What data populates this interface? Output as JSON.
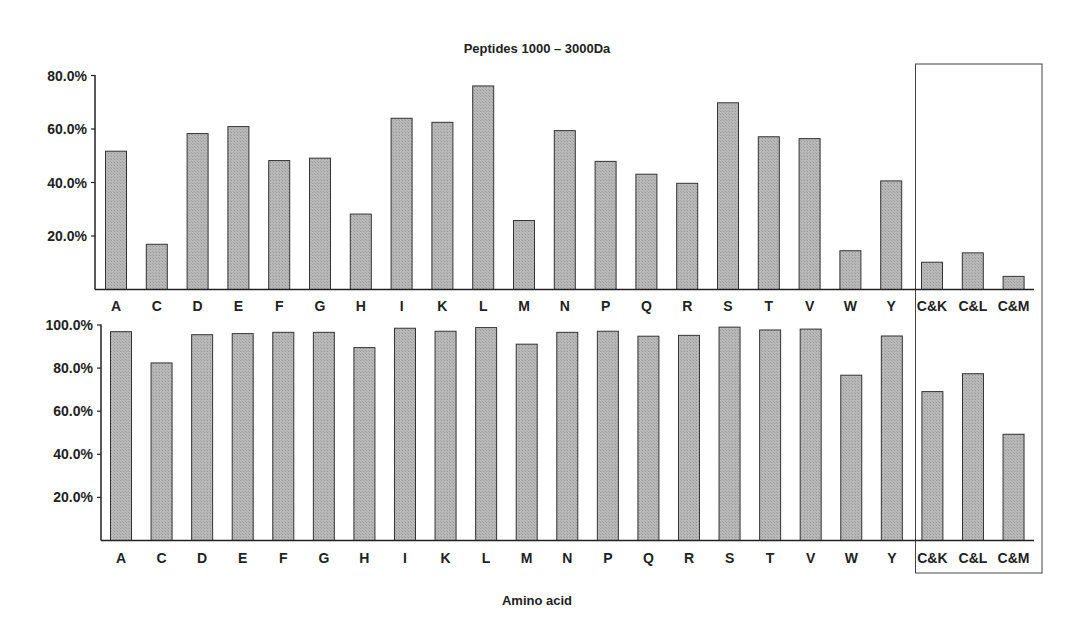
{
  "title": "Peptides 1000 – 3000Da",
  "xlabel": "Amino acid",
  "colors": {
    "bar_fill": "#b3b3b3",
    "bar_stroke": "#333333",
    "axis": "#222222",
    "highlight_box": "#444444"
  },
  "highlight_box_categories": [
    "C&K",
    "C&L",
    "C&M"
  ],
  "chart_data": [
    {
      "type": "bar",
      "panel": "top",
      "title": "Peptides 1000 – 3000Da",
      "xlabel": "",
      "ylabel": "",
      "categories": [
        "A",
        "C",
        "D",
        "E",
        "F",
        "G",
        "H",
        "I",
        "K",
        "L",
        "M",
        "N",
        "P",
        "Q",
        "R",
        "S",
        "T",
        "V",
        "W",
        "Y",
        "C&K",
        "C&L",
        "C&M"
      ],
      "values": [
        51.7,
        16.9,
        58.3,
        60.9,
        48.2,
        49.1,
        28.2,
        64.0,
        62.5,
        76.1,
        25.8,
        59.4,
        47.9,
        43.1,
        39.7,
        69.8,
        57.1,
        56.4,
        14.5,
        40.6,
        10.2,
        13.7,
        4.9
      ],
      "yticks": [
        "20.0%",
        "40.0%",
        "60.0%",
        "80.0%"
      ],
      "ylim": [
        0,
        80
      ],
      "grid": false,
      "legend": null
    },
    {
      "type": "bar",
      "panel": "bottom",
      "title": "",
      "xlabel": "Amino acid",
      "ylabel": "",
      "categories": [
        "A",
        "C",
        "D",
        "E",
        "F",
        "G",
        "H",
        "I",
        "K",
        "L",
        "M",
        "N",
        "P",
        "Q",
        "R",
        "S",
        "T",
        "V",
        "W",
        "Y",
        "C&K",
        "C&L",
        "C&M"
      ],
      "values": [
        96.9,
        82.4,
        95.5,
        96.0,
        96.6,
        96.6,
        89.5,
        98.5,
        97.1,
        98.8,
        91.1,
        96.6,
        97.1,
        94.8,
        95.2,
        99.0,
        97.7,
        98.1,
        76.7,
        94.9,
        69.1,
        77.4,
        49.3
      ],
      "yticks": [
        "20.0%",
        "40.0%",
        "60.0%",
        "80.0%",
        "100.0%"
      ],
      "ylim": [
        0,
        100
      ],
      "grid": false,
      "legend": null
    }
  ]
}
